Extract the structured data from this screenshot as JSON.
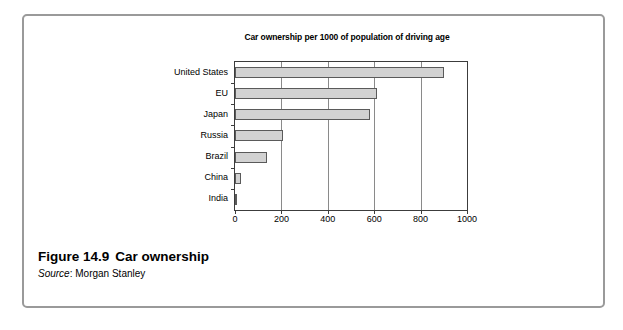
{
  "figure": {
    "number_label": "Figure 14.9",
    "caption": "Car ownership",
    "source_label": "Source",
    "source_separator": ":",
    "source_value": "Morgan Stanley"
  },
  "chart_data": {
    "type": "bar",
    "orientation": "horizontal",
    "title": "Car ownership per 1000 of population of driving age",
    "title_line1": "Car ownership per 1000 of population of",
    "title_line2": "driving age",
    "xlabel": "",
    "ylabel": "",
    "categories": [
      "United States",
      "EU",
      "Japan",
      "Russia",
      "Brazil",
      "China",
      "India"
    ],
    "values": [
      900,
      610,
      580,
      205,
      140,
      25,
      10
    ],
    "xlim": [
      0,
      1000
    ],
    "xticks": [
      0,
      200,
      400,
      600,
      800,
      1000
    ],
    "xtick_labels": [
      "0",
      "200",
      "400",
      "600",
      "800",
      "1000"
    ],
    "grid": "vertical",
    "legend": "none",
    "bar_color": "#d2d2d2",
    "bar_border_color": "#5a5a5a",
    "axis_color": "#3c3c3c"
  }
}
